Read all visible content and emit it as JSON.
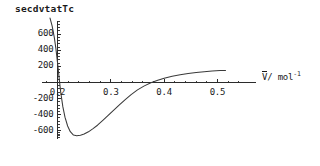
{
  "chart_data": {
    "type": "line",
    "title": "secdvtatTc",
    "xlabel": "V̄/ mol⁻¹",
    "ylabel": "",
    "xlim": [
      0.168,
      0.525
    ],
    "ylim": [
      -760,
      800
    ],
    "grid": false,
    "legend": false,
    "x_ticks": [
      0.2,
      0.3,
      0.4,
      0.5
    ],
    "x_tick_labels": [
      "0.2",
      "0.3",
      "0.4",
      "0.5"
    ],
    "y_ticks": [
      600,
      400,
      200,
      -200,
      -400,
      -600
    ],
    "y_tick_labels": [
      "600",
      "400",
      "200",
      "-200",
      "-400",
      "-600"
    ],
    "y_ticks_unlabeled": [
      0
    ],
    "minor_tick_count_between": 4,
    "axis_color": "#2b2b2b",
    "curve_color": "#3a3a3a",
    "series": [
      {
        "name": "second derivative of V at Tc",
        "x": [
          0.186,
          0.19,
          0.194,
          0.197,
          0.2,
          0.203,
          0.206,
          0.21,
          0.214,
          0.219,
          0.224,
          0.23,
          0.236,
          0.243,
          0.25,
          0.258,
          0.266,
          0.275,
          0.285,
          0.295,
          0.305,
          0.316,
          0.327,
          0.338,
          0.35,
          0.362,
          0.375,
          0.388,
          0.4,
          0.415,
          0.43,
          0.445,
          0.46,
          0.475,
          0.49,
          0.505,
          0.515
        ],
        "y": [
          800,
          700,
          560,
          420,
          250,
          60,
          -120,
          -300,
          -430,
          -540,
          -610,
          -652,
          -660,
          -655,
          -640,
          -612,
          -575,
          -530,
          -470,
          -408,
          -345,
          -278,
          -212,
          -150,
          -92,
          -45,
          -4,
          28,
          52,
          78,
          96,
          112,
          124,
          134,
          142,
          148,
          150
        ]
      }
    ],
    "annotations": {
      "zero_crossing_approx": 0.377,
      "minimum_value_approx": -660,
      "minimum_x_approx": 0.238,
      "asymptote_value_approx": 150
    }
  },
  "axes_geometry": {
    "origin_px": {
      "x": 57.5,
      "y": 82.5
    },
    "x_axis_start_px": 42,
    "x_axis_end_px": 256,
    "x_px_per_unit": 533.3,
    "y_px_per_unit": 0.0806
  }
}
